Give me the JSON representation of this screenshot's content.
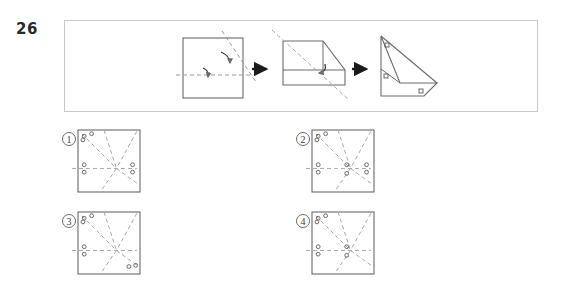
{
  "question": {
    "number": "26",
    "type": "paper-folding-punch",
    "prompt_visible": false
  },
  "stimulus": {
    "frame": {
      "x": 64,
      "y": 20,
      "width": 474,
      "height": 92,
      "border_color": "#c9c9c9"
    },
    "steps": [
      {
        "index": 1,
        "name": "unfolded-square-with-fold-lines",
        "shape": "square",
        "x": 183,
        "y": 38,
        "width": 60,
        "height": 60,
        "fold_lines": [
          {
            "type": "horizontal",
            "style": "dashed",
            "y_ratio": 0.62
          },
          {
            "type": "diagonal",
            "style": "dashed",
            "direction": "top-left-to-bottom-right"
          }
        ],
        "fold_arrows": 2
      },
      {
        "index": 2,
        "name": "half-folded-shape",
        "shape": "folded-polygon",
        "x": 281,
        "y": 40,
        "width": 62,
        "height": 52,
        "fold_lines": [
          {
            "type": "diagonal",
            "style": "dashed",
            "direction": "top-left-to-bottom-right"
          }
        ],
        "fold_arrows": 1
      },
      {
        "index": 3,
        "name": "punched-folded-shape",
        "shape": "triangle-polygon",
        "x": 379,
        "y": 34,
        "width": 58,
        "height": 62,
        "holes": 3,
        "hole_shape": "square"
      }
    ],
    "arrows": [
      {
        "name": "arrow-1",
        "x": 256,
        "y": 68
      },
      {
        "name": "arrow-2",
        "x": 355,
        "y": 68
      }
    ]
  },
  "options": [
    {
      "id": "1",
      "label": "①",
      "square": {
        "x": 78,
        "y": 130,
        "width": 62,
        "height": 62
      },
      "fold_lines": [
        {
          "type": "horizontal",
          "y_ratio": 0.62
        },
        {
          "type": "diagonal",
          "from": "top-left",
          "to": "center-right"
        },
        {
          "type": "diagonal",
          "from": "top-mid",
          "to": "bottom-mid"
        },
        {
          "type": "diagonal",
          "from": "top-right",
          "to": "center"
        }
      ],
      "holes": [
        {
          "x_ratio": 0.1,
          "y_ratio": 0.1
        },
        {
          "x_ratio": 0.08,
          "y_ratio": 0.16
        },
        {
          "x_ratio": 0.22,
          "y_ratio": 0.06
        },
        {
          "x_ratio": 0.1,
          "y_ratio": 0.56
        },
        {
          "x_ratio": 0.1,
          "y_ratio": 0.68
        },
        {
          "x_ratio": 0.88,
          "y_ratio": 0.56
        },
        {
          "x_ratio": 0.88,
          "y_ratio": 0.68
        }
      ]
    },
    {
      "id": "2",
      "label": "②",
      "square": {
        "x": 312,
        "y": 130,
        "width": 62,
        "height": 62
      },
      "fold_lines": [
        {
          "type": "horizontal",
          "y_ratio": 0.62
        },
        {
          "type": "diagonal",
          "from": "top-left",
          "to": "center-right"
        },
        {
          "type": "diagonal",
          "from": "top-mid",
          "to": "bottom-mid"
        },
        {
          "type": "diagonal",
          "from": "top-right",
          "to": "center"
        }
      ],
      "holes": [
        {
          "x_ratio": 0.1,
          "y_ratio": 0.1
        },
        {
          "x_ratio": 0.08,
          "y_ratio": 0.16
        },
        {
          "x_ratio": 0.22,
          "y_ratio": 0.06
        },
        {
          "x_ratio": 0.1,
          "y_ratio": 0.56
        },
        {
          "x_ratio": 0.1,
          "y_ratio": 0.68
        },
        {
          "x_ratio": 0.56,
          "y_ratio": 0.56
        },
        {
          "x_ratio": 0.56,
          "y_ratio": 0.7
        },
        {
          "x_ratio": 0.88,
          "y_ratio": 0.56
        },
        {
          "x_ratio": 0.88,
          "y_ratio": 0.68
        }
      ]
    },
    {
      "id": "3",
      "label": "③",
      "square": {
        "x": 78,
        "y": 212,
        "width": 62,
        "height": 62
      },
      "fold_lines": [
        {
          "type": "horizontal",
          "y_ratio": 0.62
        },
        {
          "type": "diagonal",
          "from": "top-left",
          "to": "center-right"
        },
        {
          "type": "diagonal",
          "from": "top-mid",
          "to": "bottom-mid"
        },
        {
          "type": "diagonal",
          "from": "top-right",
          "to": "center"
        }
      ],
      "holes": [
        {
          "x_ratio": 0.1,
          "y_ratio": 0.1
        },
        {
          "x_ratio": 0.08,
          "y_ratio": 0.16
        },
        {
          "x_ratio": 0.22,
          "y_ratio": 0.06
        },
        {
          "x_ratio": 0.1,
          "y_ratio": 0.56
        },
        {
          "x_ratio": 0.1,
          "y_ratio": 0.68
        },
        {
          "x_ratio": 0.82,
          "y_ratio": 0.88
        },
        {
          "x_ratio": 0.93,
          "y_ratio": 0.86
        }
      ]
    },
    {
      "id": "4",
      "label": "④",
      "square": {
        "x": 312,
        "y": 212,
        "width": 62,
        "height": 62
      },
      "fold_lines": [
        {
          "type": "horizontal",
          "y_ratio": 0.62
        },
        {
          "type": "diagonal",
          "from": "top-left",
          "to": "center-right"
        },
        {
          "type": "diagonal",
          "from": "top-mid",
          "to": "bottom-mid"
        },
        {
          "type": "diagonal",
          "from": "top-right",
          "to": "center"
        }
      ],
      "holes": [
        {
          "x_ratio": 0.1,
          "y_ratio": 0.1
        },
        {
          "x_ratio": 0.08,
          "y_ratio": 0.16
        },
        {
          "x_ratio": 0.22,
          "y_ratio": 0.06
        },
        {
          "x_ratio": 0.1,
          "y_ratio": 0.56
        },
        {
          "x_ratio": 0.1,
          "y_ratio": 0.68
        },
        {
          "x_ratio": 0.56,
          "y_ratio": 0.56
        },
        {
          "x_ratio": 0.56,
          "y_ratio": 0.7
        }
      ]
    }
  ],
  "colors": {
    "stroke": "#5a5a5a",
    "dashed": "#a8a8a8",
    "frame": "#c9c9c9",
    "text": "#2b2b2b",
    "arrow": "#1a1a1a"
  }
}
